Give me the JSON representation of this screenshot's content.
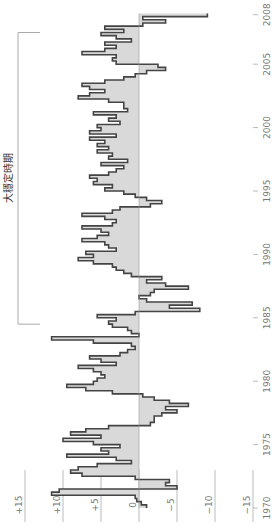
{
  "chart_data": {
    "type": "line",
    "subtype": "step-area",
    "orientation": "rotated-90",
    "title": "",
    "xlabel": "",
    "ylabel": "",
    "time_axis": {
      "ticks": [
        "1970",
        "1975",
        "1980",
        "1985",
        "1990",
        "1995",
        "2000",
        "2005",
        "2008"
      ],
      "range": [
        1970,
        2008.99
      ]
    },
    "value_axis": {
      "ticks": [
        "+15",
        "+10",
        "+5",
        "0",
        "−5",
        "−10",
        "−15"
      ],
      "tick_values": [
        15,
        10,
        5,
        0,
        -5,
        -10,
        -15
      ],
      "range": [
        -15,
        15
      ]
    },
    "grid": false,
    "legend": null,
    "annotation": {
      "label": "大穩定時期",
      "start": 1984.5,
      "end": 2007.5
    },
    "colors": {
      "fill": "#d9d9d9",
      "stroke": "#444444",
      "axis": "#bbbbbb",
      "text": "#777777"
    },
    "series": [
      {
        "name": "quarterly change",
        "frequency": "quarterly",
        "start": "1970Q1",
        "values": [
          -1.0,
          -0.3,
          0.3,
          0.5,
          11.5,
          10.5,
          -5.0,
          -3.5,
          -4.0,
          0.5,
          7.5,
          9.0,
          8.0,
          5.5,
          1.0,
          3.0,
          9.5,
          4.0,
          5.0,
          2.5,
          6.0,
          10.0,
          5.0,
          9.0,
          7.0,
          4.0,
          -1.5,
          -2.0,
          -2.0,
          -3.0,
          -5.0,
          -3.5,
          -6.5,
          -4.0,
          -2.0,
          -0.5,
          3.5,
          7.0,
          9.5,
          6.0,
          5.5,
          4.5,
          5.0,
          6.0,
          8.0,
          3.0,
          5.0,
          6.5,
          2.5,
          1.5,
          0.5,
          1.0,
          6.0,
          11.5,
          0.0,
          1.0,
          1.5,
          3.5,
          4.0,
          3.0,
          5.5,
          0.5,
          -8.0,
          -4.0,
          -7.0,
          -1.0,
          0.0,
          -1.5,
          -2.0,
          -6.5,
          -3.5,
          -1.0,
          -3.0,
          1.0,
          2.0,
          3.0,
          3.5,
          6.0,
          8.0,
          6.0,
          7.0,
          3.0,
          4.0,
          4.5,
          7.5,
          5.5,
          4.0,
          5.0,
          7.5,
          3.5,
          3.0,
          4.5,
          7.5,
          3.5,
          2.5,
          -1.5,
          -3.0,
          -1.0,
          0.5,
          2.0,
          4.5,
          3.5,
          6.0,
          5.5,
          6.5,
          4.0,
          3.0,
          2.0,
          5.0,
          1.5,
          4.0,
          3.5,
          5.5,
          4.0,
          5.5,
          4.5,
          6.5,
          3.0,
          6.5,
          5.0,
          5.5,
          2.5,
          4.0,
          3.0,
          6.0,
          1.5,
          2.0,
          2.0,
          4.0,
          8.0,
          6.5,
          4.5,
          6.5,
          7.5,
          4.5,
          2.0,
          0.5,
          -1.0,
          -3.5,
          -2.5,
          3.0,
          3.5,
          3.0,
          7.5,
          4.5,
          3.0,
          4.5,
          1.0,
          3.0,
          5.0,
          2.0,
          4.5,
          -0.5,
          -3.5,
          -0.5,
          -9.0
        ]
      }
    ]
  }
}
